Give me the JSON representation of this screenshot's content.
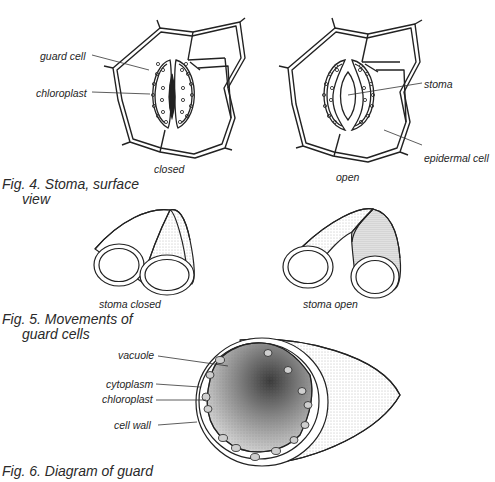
{
  "figures": {
    "fig4": {
      "caption_line1": "Fig. 4. Stoma, surface",
      "caption_line2": "view",
      "closed": {
        "sublabel": "closed",
        "labels": {
          "guard_cell": "guard cell",
          "chloroplast": "chloroplast"
        }
      },
      "open": {
        "sublabel": "open",
        "labels": {
          "stoma": "stoma",
          "epidermal_cell": "epidermal cell"
        }
      }
    },
    "fig5": {
      "caption_line1": "Fig. 5. Movements of",
      "caption_line2": "guard cells",
      "closed_label": "stoma closed",
      "open_label": "stoma open"
    },
    "fig6": {
      "caption_line1": "Fig. 6. Diagram of guard",
      "labels": {
        "vacuole": "vacuole",
        "cytoplasm": "cytoplasm",
        "chloroplast": "chloroplast",
        "cell_wall": "cell wall"
      }
    }
  },
  "colors": {
    "ink": "#222222",
    "background": "#ffffff",
    "stipple": "#8a8a8a"
  }
}
